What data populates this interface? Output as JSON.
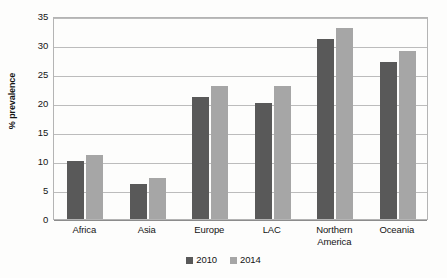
{
  "chart_data": {
    "type": "bar",
    "title": "",
    "xlabel": "",
    "ylabel": "% prevalence",
    "ylim": [
      0,
      35
    ],
    "ytick_step": 5,
    "yticks": [
      35,
      30,
      25,
      20,
      15,
      10,
      5,
      0
    ],
    "grid": true,
    "legend_position": "bottom-center",
    "categories": [
      "Africa",
      "Asia",
      "Europe",
      "LAC",
      "Northern America",
      "Oceania"
    ],
    "category_labels": [
      [
        "Africa"
      ],
      [
        "Asia"
      ],
      [
        "Europe"
      ],
      [
        "LAC"
      ],
      [
        "Northern",
        "America"
      ],
      [
        "Oceania"
      ]
    ],
    "series": [
      {
        "name": "2010",
        "color": "#595959",
        "values": [
          10,
          6,
          21,
          20,
          31,
          27
        ]
      },
      {
        "name": "2014",
        "color": "#a6a6a6",
        "values": [
          11,
          7,
          23,
          23,
          33,
          29
        ]
      }
    ]
  },
  "legend": {
    "items": [
      {
        "label": "2010"
      },
      {
        "label": "2014"
      }
    ]
  },
  "colors": {
    "series_2010": "#595959",
    "series_2014": "#a6a6a6",
    "gridline": "#bcbcbc",
    "axis": "#8c8c8c",
    "background": "#fdfdfc",
    "text": "#141414"
  }
}
